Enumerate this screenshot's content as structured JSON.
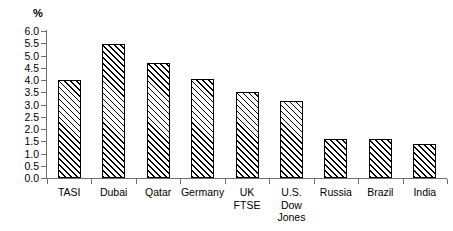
{
  "chart_data": {
    "type": "bar",
    "title": "",
    "subtitle": "",
    "xlabel": "",
    "ylabel": "%",
    "unit_label": "%",
    "ylim": [
      0.0,
      6.0
    ],
    "ytick_step": 0.5,
    "grid": false,
    "legend": null,
    "legend_position": "none",
    "bar_style": {
      "fill": "#ffffff",
      "edge": "#000000",
      "hatch": "/",
      "hatch_description": "forward diagonal lines, lower-left to upper-right"
    },
    "axis_color": "#6e6e6e",
    "categories": [
      "TASI",
      "Dubai",
      "Qatar",
      "Germany",
      "UK FTSE",
      "U.S. Dow Jones",
      "Russia",
      "Brazil",
      "India"
    ],
    "category_label_lines": [
      [
        "TASI"
      ],
      [
        "Dubai"
      ],
      [
        "Qatar"
      ],
      [
        "Germany"
      ],
      [
        "UK",
        "FTSE"
      ],
      [
        "U.S.",
        "Dow",
        "Jones"
      ],
      [
        "Russia"
      ],
      [
        "Brazil"
      ],
      [
        "India"
      ]
    ],
    "values": [
      4.0,
      5.45,
      4.7,
      4.05,
      3.5,
      3.15,
      1.6,
      1.6,
      1.4
    ],
    "ytick_labels": [
      "0.0",
      "0.5",
      "1.0",
      "1.5",
      "2.0",
      "2.5",
      "3.0",
      "3.5",
      "4.0",
      "4.5",
      "5.0",
      "5.5",
      "6.0"
    ],
    "ytick_values": [
      0.0,
      0.5,
      1.0,
      1.5,
      2.0,
      2.5,
      3.0,
      3.5,
      4.0,
      4.5,
      5.0,
      5.5,
      6.0
    ]
  }
}
